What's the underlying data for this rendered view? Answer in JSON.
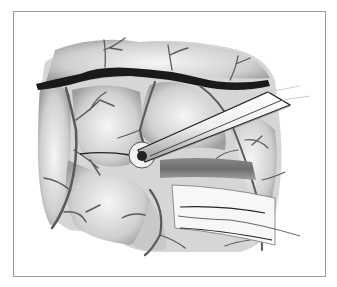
{
  "illustration": {
    "subject": "surgical illustration of cortical surface with vessels, instrument tip and cottonoid strip",
    "palette": {
      "background": "#ffffff",
      "frame": "#9a9a9a",
      "tissue_light": "#e6e6e6",
      "tissue_mid": "#bdbdbd",
      "tissue_dark": "#8c8c8c",
      "vessel": "#5a5a5a",
      "major_vessel": "#1a1a1a",
      "instrument": "#f4f4f4"
    }
  }
}
